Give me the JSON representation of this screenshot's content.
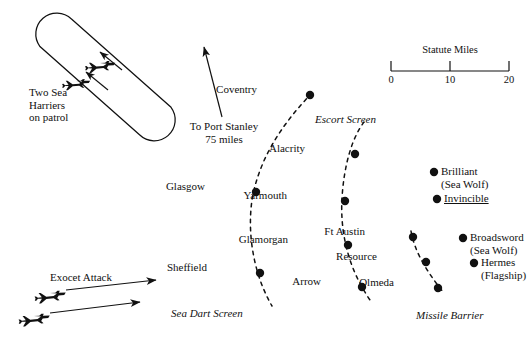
{
  "figure": {
    "type": "naval-task-force-disposition-map",
    "background_color": "#ffffff",
    "ink_color": "#111111"
  },
  "scale_bar": {
    "title": "Statute Miles",
    "ticks": [
      "0",
      "10",
      "20"
    ],
    "x_start": 391,
    "x_end": 509,
    "y": 71
  },
  "annotations": {
    "harriers": {
      "line1": "Two Sea",
      "line2": "Harriers",
      "line3": "on patrol"
    },
    "port_stanley": {
      "line1": "To Port Stanley",
      "line2": "75 miles"
    },
    "exocet": {
      "label": "Exocet Attack"
    }
  },
  "screens": [
    {
      "name": "sea-dart-screen",
      "label": "Sea Dart Screen",
      "x": 171,
      "y": 307
    },
    {
      "name": "escort-screen",
      "label": "Escort Screen",
      "x": 315,
      "y": 113
    },
    {
      "name": "missile-barrier",
      "label": "Missile Barrier",
      "x": 416,
      "y": 309
    }
  ],
  "units": [
    {
      "name": "coventry",
      "label": "Coventry",
      "dot_x": 310,
      "dot_y": 95,
      "label_x": 257,
      "label_y": 83,
      "align": "right",
      "underline": false,
      "sub": ""
    },
    {
      "name": "glasgow",
      "label": "Glasgow",
      "dot_x": 256,
      "dot_y": 192,
      "label_x": 205,
      "label_y": 180,
      "align": "right",
      "underline": false,
      "sub": ""
    },
    {
      "name": "sheffield",
      "label": "Sheffield",
      "dot_x": 260,
      "dot_y": 273,
      "label_x": 207,
      "label_y": 261,
      "align": "right",
      "underline": false,
      "sub": ""
    },
    {
      "name": "alacrity",
      "label": "Alacrity",
      "dot_x": 355,
      "dot_y": 154,
      "label_x": 305,
      "label_y": 142,
      "align": "right",
      "underline": false,
      "sub": ""
    },
    {
      "name": "yarmouth",
      "label": "Yarmouth",
      "dot_x": 345,
      "dot_y": 201,
      "label_x": 287,
      "label_y": 189,
      "align": "right",
      "underline": false,
      "sub": ""
    },
    {
      "name": "glamorgan",
      "label": "Glamorgan",
      "dot_x": 348,
      "dot_y": 245,
      "label_x": 288,
      "label_y": 233,
      "align": "right",
      "underline": false,
      "sub": ""
    },
    {
      "name": "arrow",
      "label": "Arrow",
      "dot_x": 362,
      "dot_y": 287,
      "label_x": 321,
      "label_y": 275,
      "align": "right",
      "underline": false,
      "sub": ""
    },
    {
      "name": "ft-austin",
      "label": "Ft Austin",
      "dot_x": 413,
      "dot_y": 237,
      "label_x": 365,
      "label_y": 225,
      "align": "right",
      "underline": false,
      "sub": ""
    },
    {
      "name": "resource",
      "label": "Resource",
      "dot_x": 426,
      "dot_y": 262,
      "label_x": 377,
      "label_y": 250,
      "align": "right",
      "underline": false,
      "sub": ""
    },
    {
      "name": "olmeda",
      "label": "Olmeda",
      "dot_x": 438,
      "dot_y": 288,
      "label_x": 394,
      "label_y": 276,
      "align": "right",
      "underline": false,
      "sub": ""
    },
    {
      "name": "brilliant",
      "label": "Brilliant",
      "dot_x": 434,
      "dot_y": 172,
      "label_x": 441,
      "label_y": 165,
      "align": "left",
      "underline": false,
      "sub": "(Sea Wolf)"
    },
    {
      "name": "invincible",
      "label": "Invincible",
      "dot_x": 437,
      "dot_y": 199,
      "label_x": 444,
      "label_y": 192,
      "align": "left",
      "underline": true,
      "sub": ""
    },
    {
      "name": "broadsword",
      "label": "Broadsword",
      "dot_x": 463,
      "dot_y": 238,
      "label_x": 470,
      "label_y": 231,
      "align": "left",
      "underline": false,
      "sub": "(Sea Wolf)"
    },
    {
      "name": "hermes",
      "label": "Hermes",
      "dot_x": 474,
      "dot_y": 263,
      "label_x": 481,
      "label_y": 256,
      "align": "left",
      "underline": true,
      "sub": "(Flagship)"
    }
  ]
}
